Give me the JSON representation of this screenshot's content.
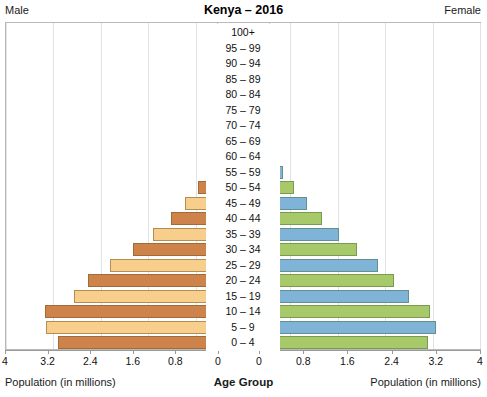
{
  "header": {
    "title": "Kenya – 2016",
    "male_label": "Male",
    "female_label": "Female"
  },
  "axis": {
    "left_title": "Population (in millions)",
    "right_title": "Population (in millions)",
    "center_title": "Age Group",
    "tick_labels": [
      "4",
      "3.2",
      "2.4",
      "1.6",
      "0.8",
      "0"
    ],
    "tick_values": [
      4,
      3.2,
      2.4,
      1.6,
      0.8,
      0
    ]
  },
  "colors": {
    "male_light": "#F7CE8B",
    "male_dark": "#CE834A",
    "female_green": "#A8C96A",
    "female_blue": "#7FB4D8",
    "grid": "#E2E2E2",
    "frame": "#B9B9B9",
    "axis": "#9A9A9A"
  },
  "chart_data": {
    "type": "bar",
    "title": "Kenya – 2016",
    "subtitle": "",
    "orientation": "horizontal",
    "layout": "population-pyramid",
    "xlabel": "Population (in millions)",
    "ylabel": "Age Group",
    "xlim": [
      0,
      4
    ],
    "grid": true,
    "legend": [
      "Male",
      "Female"
    ],
    "legend_position": "top-corners",
    "categories": [
      "100+",
      "95 – 99",
      "90 – 94",
      "85 – 89",
      "80 – 84",
      "75 – 79",
      "70 – 74",
      "65 – 69",
      "60 – 64",
      "55 – 59",
      "50 – 54",
      "45 – 49",
      "40 – 44",
      "35 – 39",
      "30 – 34",
      "25 – 29",
      "20 – 24",
      "15 – 19",
      "10 – 14",
      "5 – 9",
      "0 – 4"
    ],
    "series": [
      {
        "name": "Male",
        "side": "left",
        "values": [
          0.01,
          0.02,
          0.04,
          0.07,
          0.11,
          0.16,
          0.22,
          0.31,
          0.43,
          0.58,
          0.76,
          0.98,
          1.22,
          1.52,
          1.86,
          2.25,
          2.62,
          2.86,
          3.35,
          3.32,
          3.13
        ]
      },
      {
        "name": "Female",
        "side": "right",
        "values": [
          0.01,
          0.03,
          0.05,
          0.09,
          0.14,
          0.19,
          0.27,
          0.38,
          0.52,
          0.68,
          0.86,
          1.08,
          1.33,
          1.62,
          1.93,
          2.28,
          2.55,
          2.8,
          3.15,
          3.26,
          3.12
        ]
      }
    ],
    "bar_colors_male": [
      "#CE834A",
      "#F7CE8B",
      "#CE834A",
      "#F7CE8B",
      "#CE834A",
      "#F7CE8B",
      "#CE834A",
      "#F7CE8B",
      "#CE834A",
      "#F7CE8B",
      "#CE834A",
      "#F7CE8B",
      "#CE834A",
      "#F7CE8B",
      "#CE834A",
      "#F7CE8B",
      "#CE834A",
      "#F7CE8B",
      "#CE834A",
      "#F7CE8B",
      "#CE834A"
    ],
    "bar_colors_female": [
      "#A8C96A",
      "#7FB4D8",
      "#A8C96A",
      "#7FB4D8",
      "#A8C96A",
      "#7FB4D8",
      "#A8C96A",
      "#7FB4D8",
      "#A8C96A",
      "#7FB4D8",
      "#A8C96A",
      "#7FB4D8",
      "#A8C96A",
      "#7FB4D8",
      "#A8C96A",
      "#7FB4D8",
      "#A8C96A",
      "#7FB4D8",
      "#A8C96A",
      "#7FB4D8",
      "#A8C96A"
    ]
  }
}
